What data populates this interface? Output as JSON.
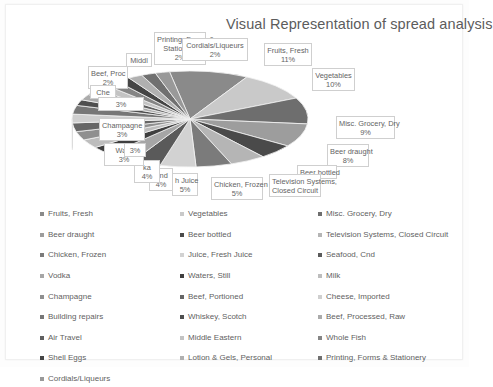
{
  "title": "Visual Representation of spread analysis",
  "chart_data": {
    "type": "pie",
    "title": "Visual Representation of spread analysis",
    "legend_position": "bottom",
    "grid": false,
    "unit": "%",
    "categories": [
      "Fruits, Fresh",
      "Vegetables",
      "Misc. Grocery, Dry",
      "Beer draught",
      "Beer bottled",
      "Television Systems, Closed Circuit",
      "Chicken, Frozen",
      "Juice, Fresh Juice",
      "Seafood, Cnd",
      "Vodka",
      "Waters, Still",
      "Milk",
      "Champagne",
      "Beef, Portioned",
      "Cheese, Imported",
      "Building repairs",
      "Whiskey, Scotch",
      "Beef, Processed, Raw",
      "Air Travel",
      "Middle Eastern",
      "Whole Fish",
      "Shell Eggs",
      "Lotion & Gels, Personal",
      "Printing, Forms & Stationery",
      "Cordials/Liqueurs"
    ],
    "values": [
      11,
      10,
      9,
      8,
      5,
      5,
      5,
      5,
      4,
      4,
      3,
      3,
      3,
      3,
      3,
      3,
      2,
      2,
      2,
      2,
      2,
      2,
      2,
      2,
      2
    ],
    "colors": [
      "#8a8a8a",
      "#c9c9c9",
      "#6e6e6e",
      "#9d9d9d",
      "#4a4a4a",
      "#b5b5b5",
      "#7b7b7b",
      "#d2d2d2",
      "#5a5a5a",
      "#a6a6a6",
      "#3f3f3f",
      "#bdbdbd",
      "#8f8f8f",
      "#666666",
      "#cfcfcf",
      "#777777",
      "#4f4f4f",
      "#ababab",
      "#606060",
      "#c3c3c3",
      "#858585",
      "#454545",
      "#b0b0b0",
      "#707070",
      "#999999"
    ]
  },
  "data_labels": [
    {
      "name": "Printing, Forms & Stationery",
      "line1": "Printing, Forms &",
      "line2": "Stationery",
      "value": "2%"
    },
    {
      "name": "Cordials/Liqueurs",
      "line1": "Cordials/Liqueurs",
      "line2": "",
      "value": "2%"
    },
    {
      "name": "Fruits, Fresh",
      "line1": "Fruits, Fresh",
      "line2": "",
      "value": "11%"
    },
    {
      "name": "Vegetables",
      "line1": "Vegetables",
      "line2": "",
      "value": "10%"
    },
    {
      "name": "Misc. Grocery, Dry",
      "line1": "Misc. Grocery, Dry",
      "line2": "",
      "value": "9%"
    },
    {
      "name": "Beer draught",
      "line1": "Beer draught",
      "line2": "",
      "value": "8%"
    },
    {
      "name": "Beer bottled",
      "line1": "Beer bottled",
      "line2": "",
      "value": ""
    },
    {
      "name": "Television Systems, Closed Circuit",
      "line1": "Television Systems,",
      "line2": "Closed Circuit",
      "value": ""
    },
    {
      "name": "Chicken, Frozen",
      "line1": "Chicken, Frozen",
      "line2": "",
      "value": "5%"
    },
    {
      "name": "Juice, Fresh Juice",
      "line1": "h Juice",
      "line2": "",
      "value": "5%"
    },
    {
      "name": "Seafood, Cnd",
      "line1": "Cnd",
      "line2": "",
      "value": "4%"
    },
    {
      "name": "Vodka",
      "line1": "ka",
      "line2": "",
      "value": "4%"
    },
    {
      "name": "Waters, Still",
      "line1": "Wate",
      "line2": "",
      "value": "3%"
    },
    {
      "name": "Milk",
      "line1": "",
      "line2": "",
      "value": "3%"
    },
    {
      "name": "Champagne",
      "line1": "Champagne",
      "line2": "",
      "value": "3%"
    },
    {
      "name": "Middle Eastern",
      "line1": "Middl",
      "line2": "",
      "value": ""
    },
    {
      "name": "Beef, Processed, Raw",
      "line1": "Beef, Proc",
      "line2": "",
      "value": "2%"
    },
    {
      "name": "Cheese, Imported",
      "line1": "Che",
      "line2": "",
      "value": ""
    },
    {
      "name": "Building repairs",
      "line1": "",
      "line2": "",
      "value": "3%"
    }
  ],
  "legend": {
    "columns": [
      [
        {
          "label": "Fruits, Fresh",
          "color": "#8a8a8a"
        },
        {
          "label": "Beer draught",
          "color": "#9d9d9d"
        },
        {
          "label": "Chicken, Frozen",
          "color": "#7b7b7b"
        },
        {
          "label": "Vodka",
          "color": "#a6a6a6"
        },
        {
          "label": "Champagne",
          "color": "#8f8f8f"
        },
        {
          "label": "Building repairs",
          "color": "#777777"
        },
        {
          "label": "Air Travel",
          "color": "#606060"
        },
        {
          "label": "Shell Eggs",
          "color": "#454545"
        },
        {
          "label": "Cordials/Liqueurs",
          "color": "#999999"
        }
      ],
      [
        {
          "label": "Vegetables",
          "color": "#c9c9c9"
        },
        {
          "label": "Beer bottled",
          "color": "#4a4a4a"
        },
        {
          "label": "Juice, Fresh Juice",
          "color": "#d2d2d2"
        },
        {
          "label": "Waters, Still",
          "color": "#3f3f3f"
        },
        {
          "label": "Beef, Portioned",
          "color": "#666666"
        },
        {
          "label": "Whiskey, Scotch",
          "color": "#4f4f4f"
        },
        {
          "label": "Middle Eastern",
          "color": "#c3c3c3"
        },
        {
          "label": "Lotion & Gels, Personal",
          "color": "#b0b0b0"
        }
      ],
      [
        {
          "label": "Misc. Grocery, Dry",
          "color": "#6e6e6e"
        },
        {
          "label": "Television Systems, Closed Circuit",
          "color": "#b5b5b5"
        },
        {
          "label": "Seafood, Cnd",
          "color": "#5a5a5a"
        },
        {
          "label": "Milk",
          "color": "#bdbdbd"
        },
        {
          "label": "Cheese, Imported",
          "color": "#cfcfcf"
        },
        {
          "label": "Beef, Processed, Raw",
          "color": "#ababab"
        },
        {
          "label": "Whole Fish",
          "color": "#858585"
        },
        {
          "label": "Printing, Forms & Stationery",
          "color": "#707070"
        }
      ]
    ]
  }
}
